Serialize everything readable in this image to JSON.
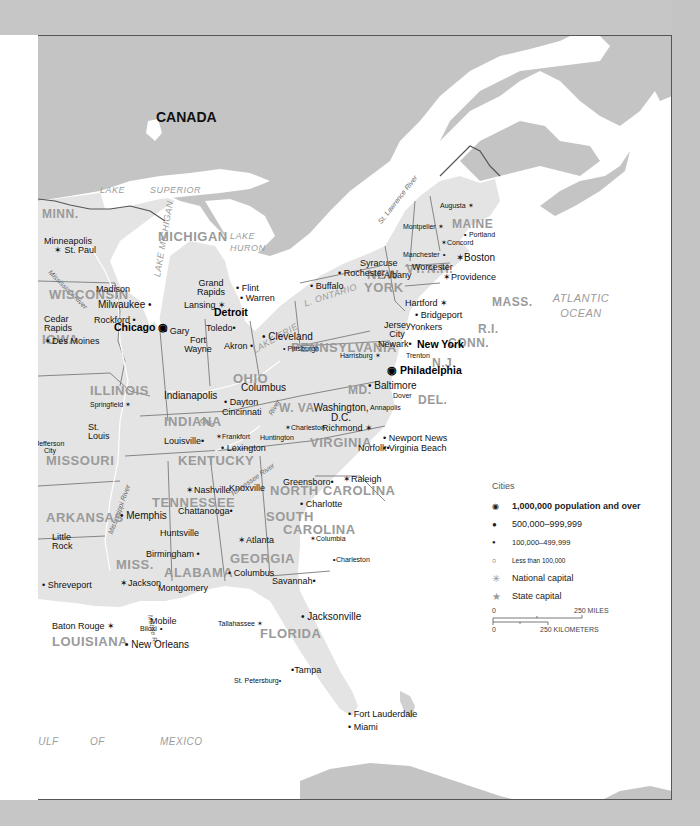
{
  "map": {
    "country_label": "CANADA",
    "water_bodies": {
      "lake_superior": [
        "LAKE",
        "SUPERIOR"
      ],
      "lake_michigan": "LAKE MICHIGAN",
      "lake_huron": [
        "LAKE",
        "HURON"
      ],
      "lake_ontario": "L. ONTARIO",
      "lake_erie": "LAKE ERIE",
      "atlantic": [
        "ATLANTIC",
        "OCEAN"
      ],
      "gulf": [
        "GULF",
        "OF",
        "MEXICO"
      ]
    },
    "rivers": {
      "st_lawrence": "St. Lawrence River",
      "mississippi_north": "Mississippi River",
      "mississippi_south": "Mississippi River",
      "ohio": "Ohio",
      "ohio_river_wv": "River",
      "tennessee": "Tennessee River",
      "mobile": "Mobile R."
    },
    "states": [
      "MINN.",
      "WISCONSIN",
      "MICHIGAN",
      "IOWA",
      "ILLINOIS",
      "INDIANA",
      "OHIO",
      "MISSOURI",
      "KENTUCKY",
      "W. VA.",
      "VIRGINIA",
      "PENNSYLVANIA",
      "NEW",
      "YORK",
      "MAINE",
      "VT.",
      "N.H.",
      "MASS.",
      "R.I.",
      "CONN.",
      "N.J.",
      "MD.",
      "DEL.",
      "TENNESSEE",
      "NORTH CAROLINA",
      "SOUTH",
      "CAROLINA",
      "ARKANSAS",
      "MISS.",
      "ALABAMA",
      "GEORGIA",
      "LOUISIANA",
      "FLORIDA"
    ],
    "cities": {
      "minneapolis": "Minneapolis",
      "st_paul": "St. Paul",
      "madison": "Madison",
      "milwaukee": "Milwaukee",
      "cedar_rapids": "Cedar Rapids",
      "rockford": "Rockford",
      "des_moines": "Des Moines",
      "chicago": "Chicago",
      "gary": "Gary",
      "grand_rapids": "Grand Rapids",
      "lansing": "Lansing",
      "flint": "Flint",
      "warren": "Warren",
      "detroit": "Detroit",
      "toledo": "Toledo",
      "fort_wayne": "Fort Wayne",
      "akron": "Akron",
      "cleveland": "Cleveland",
      "columbus_oh": "Columbus",
      "indianapolis": "Indianapolis",
      "dayton": "Dayton",
      "cincinnati": "Cincinnati",
      "springfield": "Springfield",
      "st_louis": "St. Louis",
      "jefferson_city": "Jefferson City",
      "louisville": "Louisville",
      "frankfort": "Frankfort",
      "lexington": "Lexington",
      "huntington": "Huntington",
      "charleston_wv": "Charleston",
      "buffalo": "Buffalo",
      "rochester": "Rochester",
      "syracuse": "Syracuse",
      "albany": "Albany",
      "pittsburgh": "Pittsburgh",
      "harrisburg": "Harrisburg",
      "washington": "Washington, D.C.",
      "baltimore": "Baltimore",
      "annapolis": "Annapolis",
      "dover": "Dover",
      "philadelphia": "Philadelphia",
      "trenton": "Trenton",
      "newark": "Newark",
      "jersey_city": "Jersey City",
      "yonkers": "Yonkers",
      "new_york": "New York",
      "bridgeport": "Bridgeport",
      "hartford": "Hartford",
      "providence": "Providence",
      "worcester": "Worcester",
      "boston": "Boston",
      "manchester": "Manchester",
      "concord": "Concord",
      "montpelier": "Montpelier",
      "portland": "Portland",
      "augusta": "Augusta",
      "richmond": "Richmond",
      "norfolk": "Norfolk",
      "newport_news": "Newport News",
      "virginia_beach": "Virginia Beach",
      "greensboro": "Greensboro",
      "raleigh": "Raleigh",
      "charlotte": "Charlotte",
      "nashville": "Nashville",
      "knoxville": "Knoxville",
      "chattanooga": "Chattanooga",
      "memphis": "Memphis",
      "little_rock": "Little Rock",
      "huntsville": "Huntsville",
      "birmingham": "Birmingham",
      "atlanta": "Atlanta",
      "columbia": "Columbia",
      "charleston_sc": "Charleston",
      "columbus_ga": "Columbus",
      "savannah": "Savannah",
      "jackson": "Jackson",
      "montgomery": "Montgomery",
      "shreveport": "Shreveport",
      "baton_rouge": "Baton Rouge",
      "new_orleans": "New Orleans",
      "mobile": "Mobile",
      "biloxi": "Biloxi",
      "tallahassee": "Tallahassee",
      "jacksonville": "Jacksonville",
      "tampa": "Tampa",
      "st_petersburg": "St. Petersburg",
      "fort_lauderdale": "Fort Lauderdale",
      "miami": "Miami"
    }
  },
  "legend": {
    "title": "Cities",
    "items": [
      {
        "symbol": "circled-dot",
        "label": "1,000,000 population and over"
      },
      {
        "symbol": "large-dot",
        "label": "500,000–999,999"
      },
      {
        "symbol": "small-dot",
        "label": "100,000–499,999"
      },
      {
        "symbol": "open-circle",
        "label": "Less than 100,000"
      },
      {
        "symbol": "national-capital-star",
        "label": "National capital"
      },
      {
        "symbol": "state-capital-star",
        "label": "State capital"
      }
    ]
  },
  "scale": {
    "miles_zero": "0",
    "miles_label": "250 MILES",
    "km_zero": "0",
    "km_label": "250 KILOMETERS"
  },
  "colors": {
    "land_canada": "#c4c4c4",
    "land_us": "#e4e4e4",
    "water": "#ffffff",
    "border": "#6f6f6f",
    "state_label": "#9a9a9a"
  }
}
